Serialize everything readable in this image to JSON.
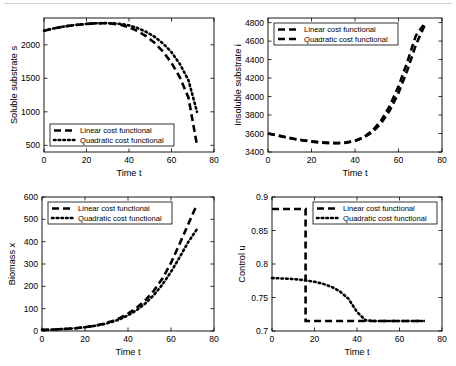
{
  "figure": {
    "title": "",
    "background": "#ffffff",
    "series_colors": {
      "linear": "#000000",
      "quadratic": "#000000"
    }
  },
  "legend_labels": {
    "linear": "Linear cost functional",
    "quadratic": "Quadratic cost functional"
  },
  "chart_data": [
    {
      "id": "soluble-substrate",
      "type": "line",
      "title": "",
      "xlabel": "Time t",
      "ylabel": "Soluble substrate s",
      "xlim": [
        0,
        80
      ],
      "ylim": [
        400,
        2400
      ],
      "xticks": [
        0,
        20,
        40,
        60,
        80
      ],
      "yticks": [
        500,
        1000,
        1500,
        2000
      ],
      "grid": false,
      "legend_position": "lower-left",
      "series": [
        {
          "name": "Linear cost functional",
          "style": "dashed",
          "x": [
            0,
            4,
            8,
            12,
            16,
            20,
            24,
            28,
            32,
            36,
            40,
            44,
            48,
            52,
            56,
            60,
            64,
            68,
            72
          ],
          "values": [
            2210,
            2240,
            2265,
            2285,
            2300,
            2312,
            2320,
            2322,
            2316,
            2300,
            2262,
            2205,
            2130,
            2030,
            1900,
            1730,
            1510,
            1210,
            500
          ]
        },
        {
          "name": "Quadratic cost functional",
          "style": "dotted",
          "x": [
            0,
            4,
            8,
            12,
            16,
            20,
            24,
            28,
            32,
            36,
            40,
            44,
            48,
            52,
            56,
            60,
            64,
            68,
            72
          ],
          "values": [
            2210,
            2240,
            2265,
            2285,
            2300,
            2312,
            2320,
            2324,
            2322,
            2312,
            2290,
            2250,
            2195,
            2120,
            2020,
            1890,
            1710,
            1470,
            1000
          ]
        }
      ]
    },
    {
      "id": "insoluble-substrate",
      "type": "line",
      "title": "",
      "xlabel": "Time t",
      "ylabel": "Insoluble substrate i",
      "xlim": [
        0,
        80
      ],
      "ylim": [
        3400,
        4850
      ],
      "xticks": [
        0,
        20,
        40,
        60,
        80
      ],
      "yticks": [
        3400,
        3600,
        3800,
        4000,
        4200,
        4400,
        4600,
        4800
      ],
      "grid": false,
      "legend_position": "upper-left",
      "series": [
        {
          "name": "Linear cost functional",
          "style": "dashed",
          "x": [
            0,
            4,
            8,
            12,
            16,
            20,
            24,
            28,
            32,
            36,
            40,
            44,
            48,
            52,
            56,
            60,
            64,
            68,
            72
          ],
          "values": [
            3600,
            3580,
            3560,
            3540,
            3525,
            3512,
            3502,
            3496,
            3494,
            3500,
            3520,
            3560,
            3630,
            3740,
            3900,
            4110,
            4370,
            4660,
            4790
          ]
        },
        {
          "name": "Quadratic cost functional",
          "style": "dashed",
          "x": [
            0,
            4,
            8,
            12,
            16,
            20,
            24,
            28,
            32,
            36,
            40,
            44,
            48,
            52,
            56,
            60,
            64,
            68,
            72
          ],
          "values": [
            3600,
            3582,
            3562,
            3543,
            3528,
            3516,
            3506,
            3500,
            3498,
            3504,
            3522,
            3556,
            3615,
            3710,
            3850,
            4040,
            4280,
            4560,
            4770
          ]
        }
      ]
    },
    {
      "id": "biomass",
      "type": "line",
      "title": "",
      "xlabel": "Time t",
      "ylabel": "Biomass x",
      "xlim": [
        0,
        80
      ],
      "ylim": [
        0,
        600
      ],
      "xticks": [
        0,
        20,
        40,
        60,
        80
      ],
      "yticks": [
        0,
        100,
        200,
        300,
        400,
        500,
        600
      ],
      "grid": false,
      "legend_position": "upper-left",
      "series": [
        {
          "name": "Linear cost functional",
          "style": "dashed",
          "x": [
            0,
            4,
            8,
            12,
            16,
            20,
            24,
            28,
            32,
            36,
            40,
            44,
            48,
            52,
            56,
            60,
            64,
            68,
            72
          ],
          "values": [
            5,
            6,
            8,
            10,
            13,
            17,
            23,
            31,
            42,
            57,
            78,
            104,
            137,
            180,
            235,
            305,
            390,
            478,
            565
          ]
        },
        {
          "name": "Quadratic cost functional",
          "style": "dotted",
          "x": [
            0,
            4,
            8,
            12,
            16,
            20,
            24,
            28,
            32,
            36,
            40,
            44,
            48,
            52,
            56,
            60,
            64,
            68,
            72
          ],
          "values": [
            5,
            6,
            8,
            10,
            13,
            17,
            22,
            29,
            39,
            52,
            70,
            93,
            123,
            161,
            208,
            265,
            330,
            398,
            455
          ]
        }
      ]
    },
    {
      "id": "control",
      "type": "line",
      "title": "",
      "xlabel": "Time t",
      "ylabel": "Control u",
      "xlim": [
        0,
        80
      ],
      "ylim": [
        0.7,
        0.9
      ],
      "xticks": [
        0,
        20,
        40,
        60,
        80
      ],
      "yticks": [
        0.7,
        0.75,
        0.8,
        0.85,
        0.9
      ],
      "grid": false,
      "legend_position": "upper-right",
      "series": [
        {
          "name": "Linear cost functional",
          "style": "dashed",
          "x": [
            0,
            15.8,
            15.8,
            72
          ],
          "values": [
            0.882,
            0.882,
            0.715,
            0.715
          ]
        },
        {
          "name": "Quadratic cost functional",
          "style": "dotted",
          "x": [
            0,
            4,
            8,
            12,
            16,
            20,
            24,
            28,
            32,
            36,
            40,
            44,
            48,
            52,
            56,
            60,
            64,
            68,
            72
          ],
          "values": [
            0.779,
            0.7785,
            0.778,
            0.777,
            0.7755,
            0.7735,
            0.7705,
            0.766,
            0.759,
            0.748,
            0.7285,
            0.716,
            0.715,
            0.715,
            0.715,
            0.715,
            0.715,
            0.715,
            0.715
          ]
        }
      ]
    }
  ]
}
